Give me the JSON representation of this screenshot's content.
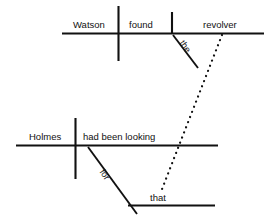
{
  "diagram": {
    "type": "reed-kellogg-sentence-diagram",
    "canvas": {
      "width": 274,
      "height": 222,
      "background": "#ffffff"
    },
    "stroke_color": "#111111",
    "main_clause": {
      "subject": "Watson",
      "verb": "found",
      "direct_object": "revolver",
      "object_modifier": "the"
    },
    "subordinate_clause": {
      "subject": "Holmes",
      "verb": "had been looking",
      "preposition": "for",
      "object_of_preposition": "that"
    },
    "connector": {
      "style": "dotted",
      "label": ""
    }
  }
}
